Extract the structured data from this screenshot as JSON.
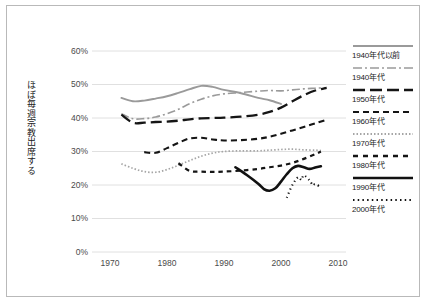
{
  "axis": {
    "y_title": "ほぼ毎週宗教出席する",
    "y_ticks": [
      "60%",
      "50%",
      "40%",
      "30%",
      "20%",
      "10%",
      "0%"
    ],
    "x_ticks": [
      "1970",
      "1980",
      "1990",
      "2000",
      "2010"
    ]
  },
  "legend": {
    "items": [
      {
        "label": "1940年代以前",
        "style": "solid-gray",
        "color": "#9a9a9a",
        "name": "legend-pre1940s"
      },
      {
        "label": "1940年代",
        "style": "dashdot-gray",
        "color": "#9a9a9a",
        "name": "legend-1940s"
      },
      {
        "label": "1950年代",
        "style": "longdash-black",
        "color": "#151515",
        "name": "legend-1950s"
      },
      {
        "label": "1960年代",
        "style": "dash-black",
        "color": "#151515",
        "name": "legend-1960s"
      },
      {
        "label": "1970年代",
        "style": "finedot-gray",
        "color": "#a5a5a5",
        "name": "legend-1970s"
      },
      {
        "label": "1980年代",
        "style": "shortdash-black",
        "color": "#151515",
        "name": "legend-1980s"
      },
      {
        "label": "1990年代",
        "style": "solid-black",
        "color": "#111111",
        "name": "legend-1990s"
      },
      {
        "label": "2000年代",
        "style": "dotted-black",
        "color": "#111111",
        "name": "legend-2000s"
      }
    ]
  },
  "chart_data": {
    "type": "line",
    "title": "",
    "xlabel": "",
    "ylabel": "ほぼ毎週宗教出席する",
    "xlim": [
      1970,
      2010
    ],
    "ylim": [
      0,
      60
    ],
    "ytick_values": [
      0,
      10,
      20,
      30,
      40,
      50,
      60
    ],
    "xtick_values": [
      1970,
      1980,
      1990,
      2000,
      2010
    ],
    "grid": "horizontal",
    "legend_position": "right",
    "units": "percent",
    "series": [
      {
        "name": "1940年代以前",
        "color": "#9a9a9a",
        "dash": "none",
        "width": 1.9,
        "points": [
          [
            1972,
            46.0
          ],
          [
            1974,
            45.0
          ],
          [
            1976,
            45.2
          ],
          [
            1978,
            45.8
          ],
          [
            1980,
            46.5
          ],
          [
            1982,
            47.5
          ],
          [
            1984,
            48.6
          ],
          [
            1986,
            49.6
          ],
          [
            1988,
            49.3
          ],
          [
            1990,
            48.4
          ],
          [
            1993,
            47.4
          ],
          [
            1996,
            46.0
          ],
          [
            1998,
            45.3
          ],
          [
            2000,
            44.2
          ]
        ]
      },
      {
        "name": "1940年代",
        "color": "#9a9a9a",
        "dash": "8,3,2,3",
        "width": 1.6,
        "points": [
          [
            1972,
            41.3
          ],
          [
            1974,
            39.8
          ],
          [
            1976,
            39.8
          ],
          [
            1978,
            40.3
          ],
          [
            1980,
            41.3
          ],
          [
            1982,
            42.6
          ],
          [
            1984,
            44.3
          ],
          [
            1986,
            45.6
          ],
          [
            1988,
            46.6
          ],
          [
            1990,
            47.2
          ],
          [
            1993,
            47.6
          ],
          [
            1996,
            48.0
          ],
          [
            1998,
            48.2
          ],
          [
            2000,
            48.1
          ],
          [
            2002,
            48.4
          ],
          [
            2004,
            48.7
          ],
          [
            2006,
            48.9
          ],
          [
            2008,
            49.1
          ]
        ]
      },
      {
        "name": "1950年代",
        "color": "#151515",
        "dash": "11,5",
        "width": 2.3,
        "points": [
          [
            1972,
            41.0
          ],
          [
            1974,
            38.6
          ],
          [
            1976,
            38.6
          ],
          [
            1978,
            38.8
          ],
          [
            1980,
            38.9
          ],
          [
            1982,
            39.2
          ],
          [
            1984,
            39.6
          ],
          [
            1986,
            39.9
          ],
          [
            1988,
            40.0
          ],
          [
            1990,
            40.1
          ],
          [
            1993,
            40.4
          ],
          [
            1996,
            41.0
          ],
          [
            1998,
            41.8
          ],
          [
            2000,
            43.1
          ],
          [
            2002,
            45.0
          ],
          [
            2004,
            46.8
          ],
          [
            2006,
            48.2
          ],
          [
            2008,
            49.0
          ]
        ]
      },
      {
        "name": "1960年代",
        "color": "#151515",
        "dash": "6,4",
        "width": 2.1,
        "points": [
          [
            1976,
            29.8
          ],
          [
            1978,
            29.6
          ],
          [
            1980,
            31.0
          ],
          [
            1982,
            32.6
          ],
          [
            1984,
            33.9
          ],
          [
            1986,
            34.1
          ],
          [
            1988,
            33.6
          ],
          [
            1990,
            33.3
          ],
          [
            1993,
            33.4
          ],
          [
            1996,
            33.8
          ],
          [
            1998,
            34.4
          ],
          [
            2000,
            35.3
          ],
          [
            2002,
            36.3
          ],
          [
            2004,
            37.3
          ],
          [
            2006,
            38.4
          ],
          [
            2008,
            39.5
          ]
        ]
      },
      {
        "name": "1970年代",
        "color": "#a5a5a5",
        "dash": "1.5,2",
        "width": 1.7,
        "points": [
          [
            1972,
            26.3
          ],
          [
            1974,
            25.0
          ],
          [
            1976,
            24.0
          ],
          [
            1978,
            23.8
          ],
          [
            1980,
            24.6
          ],
          [
            1982,
            25.9
          ],
          [
            1984,
            27.3
          ],
          [
            1986,
            28.6
          ],
          [
            1988,
            29.5
          ],
          [
            1990,
            30.0
          ],
          [
            1993,
            30.2
          ],
          [
            1996,
            30.2
          ],
          [
            1998,
            30.4
          ],
          [
            2000,
            30.6
          ],
          [
            2002,
            30.7
          ],
          [
            2004,
            30.5
          ],
          [
            2006,
            30.4
          ],
          [
            2007,
            30.3
          ]
        ]
      },
      {
        "name": "1980年代",
        "color": "#151515",
        "dash": "4.5,4",
        "width": 2.2,
        "points": [
          [
            1982,
            26.5
          ],
          [
            1984,
            24.2
          ],
          [
            1986,
            24.0
          ],
          [
            1988,
            23.9
          ],
          [
            1990,
            24.0
          ],
          [
            1993,
            24.3
          ],
          [
            1996,
            24.8
          ],
          [
            1998,
            25.3
          ],
          [
            2000,
            25.8
          ],
          [
            2002,
            26.6
          ],
          [
            2004,
            27.8
          ],
          [
            2006,
            29.2
          ],
          [
            2007,
            30.0
          ]
        ]
      },
      {
        "name": "1990年代",
        "color": "#111111",
        "dash": "none",
        "width": 2.6,
        "points": [
          [
            1992,
            25.3
          ],
          [
            1994,
            23.0
          ],
          [
            1996,
            20.4
          ],
          [
            1997,
            18.8
          ],
          [
            1998,
            18.3
          ],
          [
            1999,
            19.0
          ],
          [
            2000,
            21.0
          ],
          [
            2001,
            23.2
          ],
          [
            2002,
            25.0
          ],
          [
            2003,
            25.7
          ],
          [
            2004,
            25.3
          ],
          [
            2005,
            24.8
          ],
          [
            2006,
            25.2
          ],
          [
            2007,
            25.6
          ]
        ]
      },
      {
        "name": "2000年代",
        "color": "#111111",
        "dash": "1.2,3.2",
        "width": 2.1,
        "points": [
          [
            2001,
            16.2
          ],
          [
            2002,
            20.0
          ],
          [
            2003,
            22.3
          ],
          [
            2003.6,
            21.5
          ],
          [
            2004,
            22.9
          ],
          [
            2005,
            21.4
          ],
          [
            2005.6,
            19.9
          ],
          [
            2006,
            20.3
          ],
          [
            2007,
            19.3
          ]
        ]
      }
    ]
  }
}
